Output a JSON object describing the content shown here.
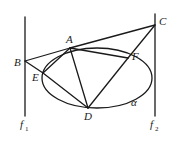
{
  "diagram": {
    "lines": {
      "f1": {
        "label": "f",
        "sub": "1",
        "x": 25,
        "y1": 17,
        "y2": 116
      },
      "f2": {
        "label": "f",
        "sub": "2",
        "x": 155,
        "y1": 14,
        "y2": 116
      }
    },
    "ellipse": {
      "label": "α",
      "cx": 97,
      "cy": 78,
      "rx": 55,
      "ry": 30
    },
    "points": {
      "A": {
        "label": "A",
        "x": 70,
        "y": 48
      },
      "B": {
        "label": "B",
        "x": 25,
        "y": 61
      },
      "C": {
        "label": "C",
        "x": 155,
        "y": 25
      },
      "D": {
        "label": "D",
        "x": 88,
        "y": 108
      },
      "E": {
        "label": "E",
        "x": 43,
        "y": 73
      },
      "F": {
        "label": "F",
        "x": 128,
        "y": 58
      }
    },
    "segments": [
      "BA",
      "BE",
      "BD",
      "AC",
      "AE",
      "AD",
      "AF",
      "CF",
      "CD"
    ]
  }
}
